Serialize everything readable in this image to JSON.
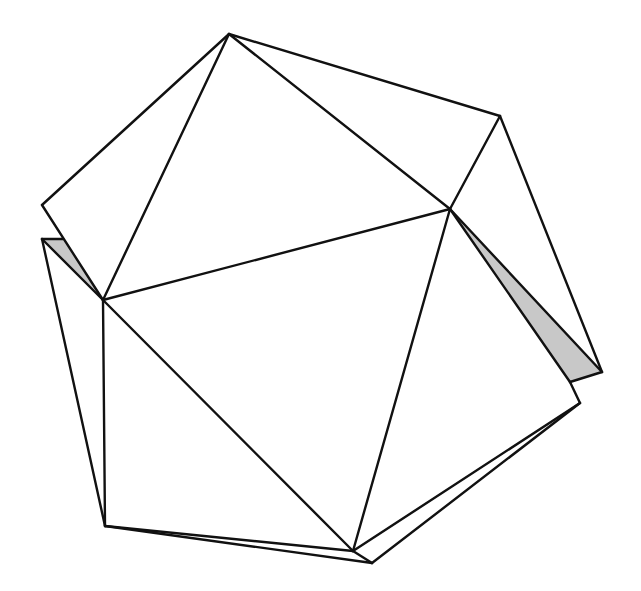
{
  "diagram": {
    "type": "polyhedron-wireframe",
    "stroke_color": "#111111",
    "shade_color": "#c8c8c8",
    "background": "#ffffff",
    "vertices": {
      "T": [
        229,
        34
      ],
      "TR": [
        500,
        116
      ],
      "L1": [
        42,
        205
      ],
      "L2": [
        42,
        239
      ],
      "L3": [
        63,
        239
      ],
      "C": [
        103,
        300
      ],
      "R": [
        450,
        209
      ],
      "FR": [
        602,
        372
      ],
      "G": [
        570,
        382
      ],
      "BR": [
        580,
        403
      ],
      "BL": [
        105,
        526
      ],
      "B": [
        353,
        551
      ],
      "B2": [
        372,
        563
      ]
    },
    "shaded_faces": [
      [
        "L2",
        "L3",
        "C"
      ],
      [
        "R",
        "FR",
        "G"
      ]
    ],
    "edges": [
      [
        "T",
        "L1"
      ],
      [
        "T",
        "C"
      ],
      [
        "T",
        "R"
      ],
      [
        "T",
        "TR"
      ],
      [
        "TR",
        "R"
      ],
      [
        "TR",
        "FR"
      ],
      [
        "L1",
        "C"
      ],
      [
        "L2",
        "L3"
      ],
      [
        "L2",
        "C"
      ],
      [
        "L2",
        "BL"
      ],
      [
        "C",
        "R"
      ],
      [
        "C",
        "B"
      ],
      [
        "C",
        "BL"
      ],
      [
        "R",
        "FR"
      ],
      [
        "R",
        "G"
      ],
      [
        "R",
        "B"
      ],
      [
        "FR",
        "G"
      ],
      [
        "G",
        "BR"
      ],
      [
        "BL",
        "B"
      ],
      [
        "BL",
        "B2"
      ],
      [
        "B",
        "BR"
      ],
      [
        "B2",
        "BR"
      ],
      [
        "B",
        "B2"
      ]
    ]
  }
}
